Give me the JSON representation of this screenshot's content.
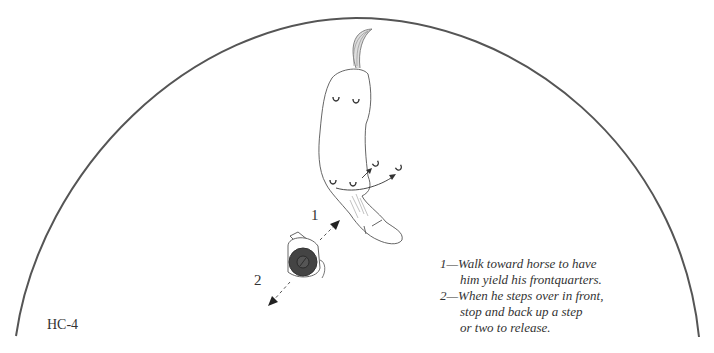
{
  "figure": {
    "label": "HC-4",
    "arena": "round pen (arc)",
    "step_markers": {
      "one": "1",
      "two": "2"
    },
    "legend": [
      {
        "text": "1—Walk toward horse to have",
        "indent": false
      },
      {
        "text": "him yield his frontquarters.",
        "indent": true
      },
      {
        "text": "2—When he steps over in front,",
        "indent": false
      },
      {
        "text": "stop and back up a step",
        "indent": true
      },
      {
        "text": "or two to release.",
        "indent": true
      }
    ]
  },
  "colors": {
    "line": "#555555",
    "ink": "#333333",
    "hat": "#444444"
  }
}
